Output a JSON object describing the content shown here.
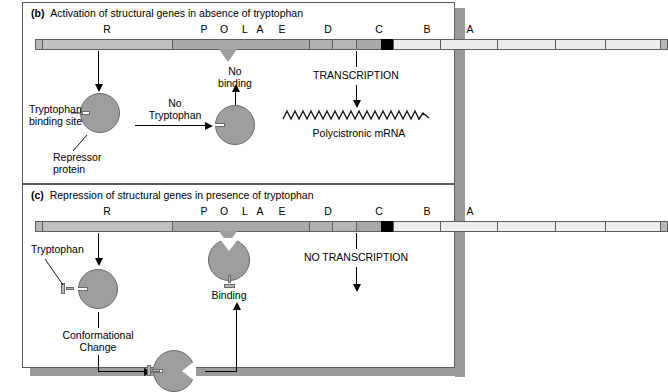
{
  "figure": {
    "panels": [
      {
        "id": "b",
        "label": "(b)",
        "caption": "Activation of structural genes in absence of tryptophan",
        "gene_map": {
          "letters": [
            "R",
            "P",
            "O",
            "L",
            "A",
            "E",
            "D",
            "C",
            "B",
            "A"
          ]
        },
        "annotations": {
          "binding_site_label_line1": "Tryptophan",
          "binding_site_label_line2": "binding site",
          "repressor_label_line1": "Repressor",
          "repressor_label_line2": "protein",
          "no_tryptophan_line1": "No",
          "no_tryptophan_line2": "Tryptophan",
          "no_binding_line1": "No",
          "no_binding_line2": "binding",
          "transcription": "TRANSCRIPTION",
          "mrna": "Polycistronic mRNA"
        }
      },
      {
        "id": "c",
        "label": "(c)",
        "caption": "Repression of structural genes in presence of tryptophan",
        "gene_map": {
          "letters": [
            "R",
            "P",
            "O",
            "L",
            "A",
            "E",
            "D",
            "C",
            "B",
            "A"
          ]
        },
        "annotations": {
          "tryptophan": "Tryptophan",
          "conformational_line1": "Conformational",
          "conformational_line2": "Change",
          "binding": "Binding",
          "no_transcription": "NO TRANSCRIPTION"
        }
      }
    ],
    "colors": {
      "repressor": "#9e9e9e",
      "attenuator": "#000000",
      "gene_segment": "#ededed",
      "regulator_segment": "#c0c0c0",
      "spacer_segment": "#a9a9a9",
      "panel_border": "#5a5a5a",
      "shadow": "#9a9a9a"
    }
  }
}
